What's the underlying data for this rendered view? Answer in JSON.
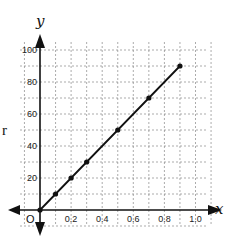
{
  "chart_data": {
    "type": "line",
    "title": "",
    "xlabel": "x",
    "ylabel": "y",
    "side_label": "r",
    "origin_label": "O",
    "x_ticks": [
      0.2,
      0.4,
      0.6,
      0.8,
      1.0
    ],
    "x_tick_labels": [
      "0.2",
      "0.4",
      "0.6",
      "0.8",
      "1.0"
    ],
    "y_ticks": [
      20,
      40,
      60,
      80,
      100
    ],
    "y_tick_labels": [
      "20",
      "40",
      "60",
      "80",
      "100"
    ],
    "xlim": [
      0,
      1.0
    ],
    "ylim": [
      0,
      100
    ],
    "grid": true,
    "grid_style": "dashed",
    "x_grid_step": 0.1,
    "y_grid_step": 10,
    "series": [
      {
        "name": "line",
        "x": [
          0,
          0.1,
          0.2,
          0.3,
          0.5,
          0.7,
          0.9
        ],
        "y": [
          0,
          10,
          20,
          30,
          50,
          70,
          90
        ],
        "markers": true,
        "color": "#111111"
      }
    ]
  }
}
